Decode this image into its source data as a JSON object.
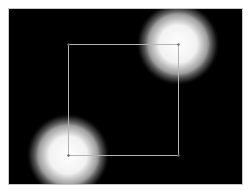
{
  "canvas": {
    "background": "#000000",
    "border_color": "#c8c8c8",
    "x": 8,
    "y": 8,
    "width": 235,
    "height": 177
  },
  "rectangle": {
    "x1": 68,
    "y1": 44,
    "x2": 178,
    "y2": 155,
    "stroke": "#b4b4b4"
  },
  "lights": [
    {
      "name": "light-top-right",
      "cx": 178,
      "cy": 44,
      "glow_radius": 42,
      "ring_radius": 30,
      "ring_color": "#9a9a9a"
    },
    {
      "name": "light-bottom-left",
      "cx": 68,
      "cy": 155,
      "glow_radius": 42,
      "ring_radius": 30,
      "ring_color": "#9a9a9a"
    }
  ],
  "vertices": [
    {
      "x": 68,
      "y": 44
    },
    {
      "x": 178,
      "y": 44
    },
    {
      "x": 178,
      "y": 155
    },
    {
      "x": 68,
      "y": 155
    }
  ]
}
